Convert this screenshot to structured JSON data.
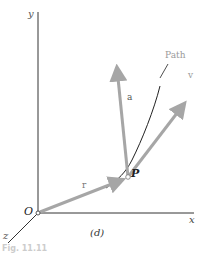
{
  "figure": {
    "axes": {
      "x": "x",
      "y": "y",
      "z": "z",
      "origin": "O"
    },
    "vectors": {
      "position": "r",
      "acceleration": "a",
      "velocity": "v"
    },
    "point": "P",
    "path_label": "Path",
    "panel_label": "(d)",
    "caption_partial": "Fig. 11.11"
  },
  "colors": {
    "vector": "#a6a6a6",
    "axis": "#333333",
    "path_label": "#9a9a9a"
  }
}
